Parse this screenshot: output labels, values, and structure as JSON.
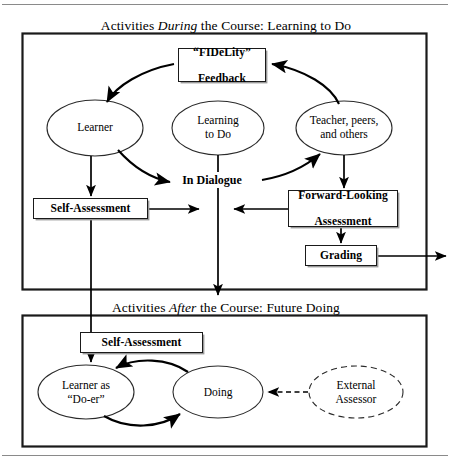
{
  "figure": {
    "sections": {
      "during": {
        "caption_prefix": "Activities ",
        "caption_emphasis": "During",
        "caption_suffix": " the Course: Learning to Do"
      },
      "after": {
        "caption_prefix": "Activities ",
        "caption_emphasis": "After",
        "caption_suffix": " the Course: Future Doing"
      }
    },
    "boxes": {
      "fidelity_line1": "“FIDeLity”",
      "fidelity_line2": "Feedback",
      "self_assessment_top": "Self-Assessment",
      "forward_line1": "Forward-Looking",
      "forward_line2": "Assessment",
      "grading": "Grading",
      "self_assessment_bottom": "Self-Assessment"
    },
    "ellipses": {
      "learner": "Learner",
      "learning_to_do_line1": "Learning",
      "learning_to_do_line2": "to Do",
      "teacher_line1": "Teacher, peers,",
      "teacher_line2": "and others",
      "doer_line1": "Learner as",
      "doer_line2": "“Do-er”",
      "doing": "Doing",
      "external_line1": "External",
      "external_line2": "Assessor"
    },
    "connectors": {
      "in_dialogue": "In Dialogue"
    },
    "colors": {
      "ink": "#000000",
      "rule": "#8a8a8a",
      "shadow": "#9a9a9a",
      "background": "#ffffff"
    }
  }
}
